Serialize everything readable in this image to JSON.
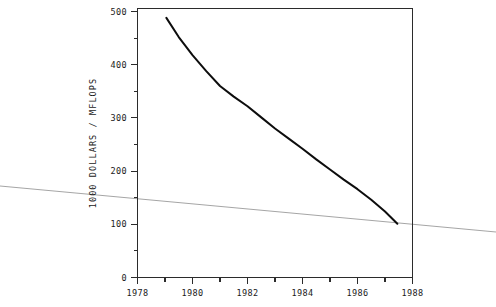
{
  "chart_data": {
    "type": "line",
    "title": "",
    "subtitle": "",
    "xlabel": "",
    "ylabel": "1000 DOLLARS / MFLOPS",
    "xlim": [
      1978,
      1988
    ],
    "ylim": [
      0,
      500
    ],
    "grid": false,
    "legend": null,
    "x_tick_labels": [
      "1978",
      "1980",
      "1982",
      "1984",
      "1986",
      "1988"
    ],
    "x_tick_values": [
      1978,
      1980,
      1982,
      1984,
      1986,
      1988
    ],
    "x_minor_ticks": [
      1979,
      1981,
      1983,
      1985,
      1987
    ],
    "y_tick_labels": [
      "0",
      "100",
      "200",
      "300",
      "400",
      "500"
    ],
    "y_tick_values": [
      0,
      100,
      200,
      300,
      400,
      500
    ],
    "y_minor_ticks": [
      50,
      150,
      250,
      350,
      450
    ],
    "series": [
      {
        "name": "cost per MFLOPS",
        "x": [
          1979.05,
          1979.5,
          1980.0,
          1980.5,
          1981.0,
          1981.5,
          1982.0,
          1982.5,
          1983.0,
          1983.5,
          1984.0,
          1984.5,
          1985.0,
          1985.5,
          1986.0,
          1986.5,
          1987.0,
          1987.45
        ],
        "values": [
          488,
          452,
          418,
          388,
          360,
          340,
          322,
          301,
          280,
          261,
          242,
          222,
          203,
          184,
          166,
          146,
          124,
          101
        ]
      }
    ],
    "annotations": [
      {
        "name": "scan-artifact-line",
        "description": "faint grey near-horizontal scanning streak across full image width",
        "color": "#9b9b9b"
      }
    ],
    "colors": {
      "curve": "#0d0d0d",
      "axis": "#2b2b2b",
      "background": "#ffffff",
      "artifact": "#9b9b9b"
    }
  }
}
